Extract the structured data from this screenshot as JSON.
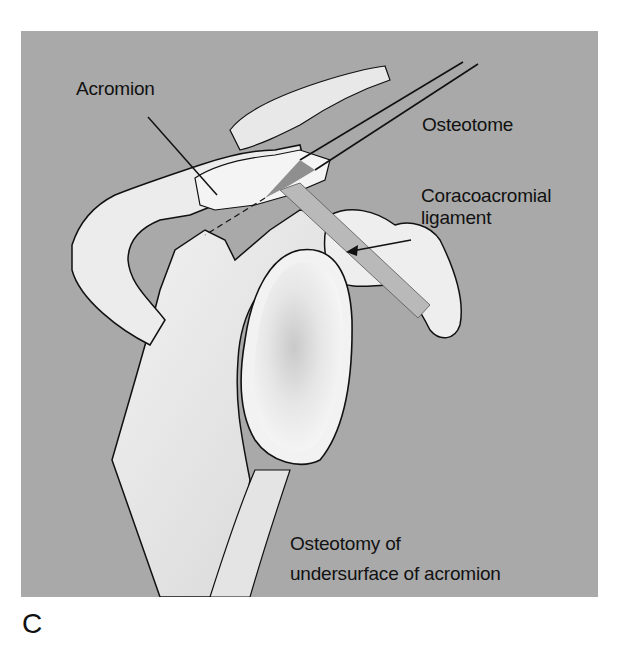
{
  "figure": {
    "panel_letter": "C",
    "background_color": "#a9a9a9",
    "labels": {
      "acromion": "Acromion",
      "osteotome": "Osteotome",
      "coracoacromial_line1": "Coracoacromial",
      "coracoacromial_line2": "ligament",
      "osteotomy_line1": "Osteotomy of",
      "osteotomy_line2": "undersurface of acromion"
    }
  }
}
